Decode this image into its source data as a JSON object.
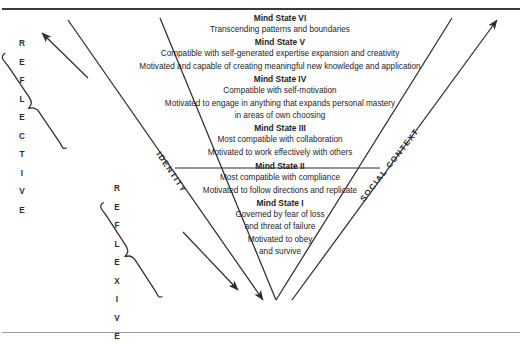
{
  "diagram": {
    "type": "v-funnel-model",
    "axis_labels": {
      "left_diagonal": "IDENTITY",
      "right_diagonal": "SOCIAL CONTEXT"
    },
    "vertical_labels": {
      "outer": "REFLECTIVE",
      "inner": "REFLEXIVE"
    },
    "mind_states": [
      {
        "title": "Mind State VI",
        "lines": [
          "Transcending patterns and boundaries"
        ]
      },
      {
        "title": "Mind State V",
        "lines": [
          "Compatible with self-generated expertise expansion and creativity",
          "Motivated and capable of creating meaningful new knowledge and application"
        ]
      },
      {
        "title": "Mind State IV",
        "lines": [
          "Compatible with self-motivation",
          "Motivated to engage in anything that expands personal mastery",
          "in areas of own choosing"
        ]
      },
      {
        "title": "Mind State III",
        "lines": [
          "Most compatible with collaboration",
          "Motivated to work effectively with others"
        ]
      },
      {
        "title": "Mind State II",
        "lines": [
          "Most compatible with compliance",
          "Motivated to follow directions and replicate"
        ]
      },
      {
        "title": "Mind State I",
        "lines": [
          "Governed by fear of loss",
          "and threat of failure",
          "Motivated to obey",
          "and survive"
        ]
      }
    ],
    "colors": {
      "ink": "#1d1d1f",
      "line": "#2d2d30",
      "rule_top": "#3a3a3c",
      "rule_bottom": "#9a9a9e",
      "background": "#ffffff"
    }
  }
}
